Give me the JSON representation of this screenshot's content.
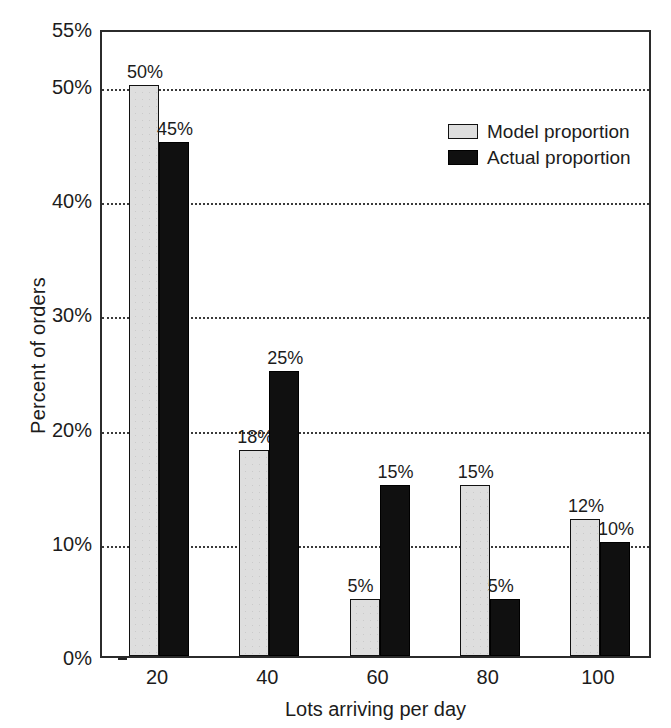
{
  "chart_data": {
    "type": "bar",
    "title": "",
    "subtitle": "",
    "xlabel": "Lots arriving per day",
    "ylabel": "Percent of orders",
    "categories": [
      "20",
      "40",
      "60",
      "80",
      "100"
    ],
    "series": [
      {
        "name": "Model proportion",
        "color": "#dedede",
        "values": [
          50,
          18,
          5,
          15,
          12
        ],
        "labels": [
          "50%",
          "18%",
          "5%",
          "15%",
          "12%"
        ]
      },
      {
        "name": "Actual proportion",
        "color": "#101010",
        "values": [
          45,
          25,
          15,
          5,
          10
        ],
        "labels": [
          "45%",
          "25%",
          "15%",
          "5%",
          "10%"
        ]
      }
    ],
    "ylim": [
      0,
      55
    ],
    "yticks": [
      0,
      10,
      20,
      30,
      40,
      50,
      55
    ],
    "ytick_labels": [
      "0%",
      "10%",
      "20%",
      "30%",
      "40%",
      "50%",
      "55%"
    ],
    "gridlines": [
      10,
      20,
      30,
      40,
      50
    ],
    "grid": true,
    "legend_position": "upper right"
  },
  "axes": {
    "ylabel": "Percent of orders",
    "xlabel": "Lots arriving per day"
  },
  "legend": {
    "items": [
      {
        "label": "Model proportion",
        "swatch": "legend-swatch-model"
      },
      {
        "label": "Actual proportion",
        "swatch": "legend-swatch-actual"
      }
    ]
  }
}
